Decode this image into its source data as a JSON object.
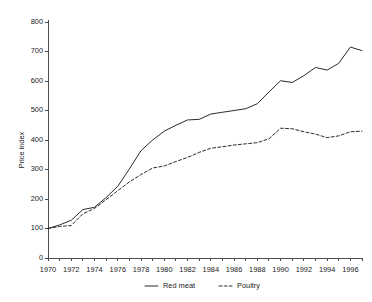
{
  "chart_data": {
    "type": "line",
    "title": "",
    "xlabel": "",
    "ylabel": "Price index",
    "xlim": [
      1970,
      1997
    ],
    "ylim": [
      0,
      800
    ],
    "yticks": [
      0,
      100,
      200,
      300,
      400,
      500,
      600,
      700,
      800
    ],
    "ytick_labels": [
      "0",
      "100",
      "200",
      "300",
      "400",
      "500",
      "600",
      "700",
      "800"
    ],
    "xticks": [
      1970,
      1971,
      1972,
      1973,
      1974,
      1975,
      1976,
      1977,
      1978,
      1979,
      1980,
      1981,
      1982,
      1983,
      1984,
      1985,
      1986,
      1987,
      1988,
      1989,
      1990,
      1991,
      1992,
      1993,
      1994,
      1995,
      1996,
      1997
    ],
    "xtick_labels": [
      "1970",
      "1972",
      "1974",
      "1976",
      "1978",
      "1980",
      "1982",
      "1984",
      "1986",
      "1988",
      "1990",
      "1992",
      "1994",
      "1996"
    ],
    "xtick_labeled_values": [
      1970,
      1972,
      1974,
      1976,
      1978,
      1980,
      1982,
      1984,
      1986,
      1988,
      1990,
      1992,
      1994,
      1996
    ],
    "grid": false,
    "legend_position": "bottom-center",
    "x": [
      1970,
      1971,
      1972,
      1973,
      1974,
      1975,
      1976,
      1977,
      1978,
      1979,
      1980,
      1981,
      1982,
      1983,
      1984,
      1985,
      1986,
      1987,
      1988,
      1989,
      1990,
      1991,
      1992,
      1993,
      1994,
      1995,
      1996,
      1997
    ],
    "series": [
      {
        "name": "Red meat",
        "style": "solid",
        "color": "#2b2b2b",
        "values": [
          100,
          112,
          128,
          164,
          172,
          205,
          243,
          302,
          364,
          400,
          430,
          450,
          468,
          470,
          488,
          494,
          500,
          506,
          523,
          563,
          601,
          595,
          618,
          646,
          637,
          660,
          715,
          703
        ]
      },
      {
        "name": "Poultry",
        "style": "dashed",
        "color": "#2b2b2b",
        "values": [
          100,
          107,
          110,
          150,
          168,
          198,
          228,
          258,
          283,
          305,
          312,
          327,
          341,
          358,
          372,
          377,
          383,
          387,
          391,
          404,
          440,
          438,
          428,
          420,
          408,
          414,
          428,
          430
        ]
      }
    ]
  },
  "legend": {
    "items": [
      {
        "label": "Red meat",
        "style": "solid"
      },
      {
        "label": "Poultry",
        "style": "dashed"
      }
    ]
  },
  "axes": {
    "y_axis_title": "Price index"
  }
}
